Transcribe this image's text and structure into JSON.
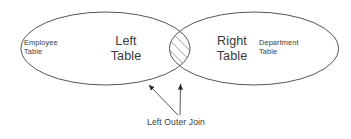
{
  "diagram": {
    "background_color": "#ffffff",
    "stroke_color": "#555555",
    "text_color": "#3a3a3a",
    "hatch_color": "#555555"
  },
  "left_set": {
    "name_label": "Left\nTable",
    "entity_label": "Employee\nTable"
  },
  "right_set": {
    "name_label": "Right\nTable",
    "entity_label": "Department\nTable"
  },
  "intersection": {
    "fill_style": "diagonal-hatch",
    "caption": "Left Outer Join"
  },
  "annotation": {
    "caption": "Left Outer Join",
    "arrow_count": 2
  }
}
